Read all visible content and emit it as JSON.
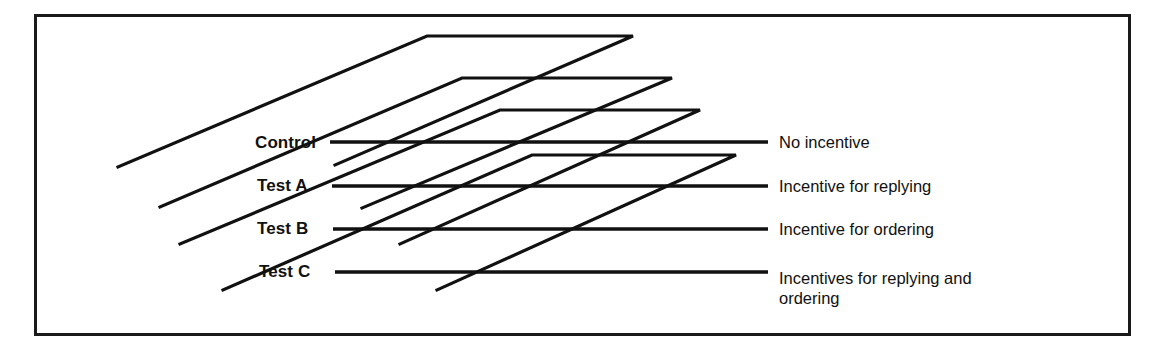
{
  "figure": {
    "background_color": "#ffffff",
    "line_color": "#111111",
    "frame_color": "#1a1a1a",
    "width": 1162,
    "height": 361
  },
  "frame": {
    "x": 34,
    "y": 14,
    "width": 1096,
    "height": 321
  },
  "groups": [
    {
      "id": "control",
      "label": "Control",
      "label_x": 255,
      "label_y": 133,
      "lead_line": {
        "x1": 330,
        "y1": 142,
        "x2": 768,
        "y2": 142
      },
      "plane": "118,167 427,36 633,36 335,165"
    },
    {
      "id": "test-a",
      "label": "Test A",
      "label_x": 257,
      "label_y": 176,
      "lead_line": {
        "x1": 332,
        "y1": 186,
        "x2": 768,
        "y2": 186
      },
      "plane": "160,207 462,78 672,78 362,208"
    },
    {
      "id": "test-b",
      "label": "Test B",
      "label_x": 257,
      "label_y": 219,
      "lead_line": {
        "x1": 333,
        "y1": 229,
        "x2": 768,
        "y2": 229
      },
      "plane": "180,244 500,110 700,110 400,244"
    },
    {
      "id": "test-c",
      "label": "Test C",
      "label_x": 259,
      "label_y": 262,
      "lead_line": {
        "x1": 335,
        "y1": 272,
        "x2": 768,
        "y2": 272
      },
      "plane": "223,290 532,155 736,155 437,290"
    }
  ],
  "treatments": [
    {
      "id": "no-incentive",
      "label": "No incentive",
      "x": 779,
      "y": 132
    },
    {
      "id": "incentive-replying",
      "label": "Incentive for replying",
      "x": 779,
      "y": 176
    },
    {
      "id": "incentive-ordering",
      "label": "Incentive for ordering",
      "x": 779,
      "y": 219
    },
    {
      "id": "incentive-replying-and-ordering",
      "label": "Incentives for replying and\nordering",
      "x": 779,
      "y": 268
    }
  ]
}
